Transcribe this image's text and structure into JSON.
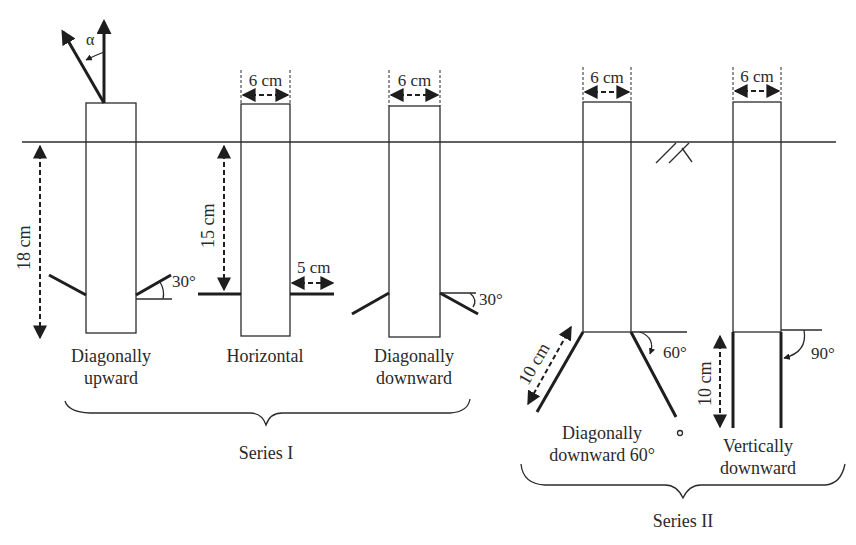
{
  "diagram": {
    "colors": {
      "stroke": "#1e1e1e",
      "background": "#ffffff",
      "text": "#2a2a2a"
    },
    "angle_symbol": "α",
    "width_label": "6 cm",
    "series": [
      {
        "name": "Series I",
        "anchors": [
          {
            "label_line1": "Diagonally",
            "label_line2": "upward",
            "angle": "30°",
            "depth": "18 cm"
          },
          {
            "label_line1": "Horizontal",
            "label_line2": "",
            "depth": "15 cm",
            "wing_length": "5 cm"
          },
          {
            "label_line1": "Diagonally",
            "label_line2": "downward",
            "angle": "30°"
          }
        ]
      },
      {
        "name": "Series II",
        "anchors": [
          {
            "label_line1": "Diagonally",
            "label_line2": "downward 60°",
            "angle": "60°",
            "leg_length": "10 cm"
          },
          {
            "label_line1": "Vertically",
            "label_line2": "downward",
            "angle": "90°",
            "leg_length": "10 cm"
          }
        ]
      }
    ]
  }
}
